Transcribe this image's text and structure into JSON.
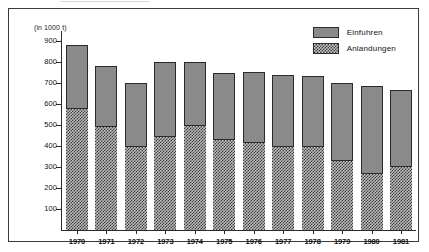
{
  "figure": {
    "unit_label": "(in 1000 t)"
  },
  "legend": {
    "items": [
      {
        "label": "Einfuhren",
        "pattern": "solid",
        "color": "#8a8a8a"
      },
      {
        "label": "Anlandungen",
        "pattern": "checkerboard",
        "color": "#3d3d3d"
      }
    ]
  },
  "axis": {
    "y_ticks": [
      900,
      800,
      700,
      600,
      500,
      400,
      300,
      200,
      100
    ],
    "y_tick_labels": [
      "900",
      "800",
      "700",
      "600",
      "500",
      "400",
      "300",
      "200",
      "100"
    ],
    "x_labels": [
      "1970",
      "1971",
      "1972",
      "1973",
      "1974",
      "1975",
      "1976",
      "1977",
      "1978",
      "1979",
      "1980",
      "1981"
    ]
  },
  "chart_data": {
    "type": "bar",
    "title": "",
    "subtitle": "",
    "xlabel": "",
    "ylabel": "(in 1000 t)",
    "ylim": [
      0,
      950
    ],
    "grid": false,
    "stacked": true,
    "legend_position": "top-right",
    "categories": [
      "1970",
      "1971",
      "1972",
      "1973",
      "1974",
      "1975",
      "1976",
      "1977",
      "1978",
      "1979",
      "1980",
      "1981"
    ],
    "series": [
      {
        "name": "Anlandungen",
        "values": [
          583,
          498,
          400,
          450,
          500,
          435,
          422,
          400,
          402,
          335,
          270,
          305
        ]
      },
      {
        "name": "Einfuhren",
        "values": [
          302,
          287,
          300,
          350,
          303,
          315,
          330,
          338,
          331,
          368,
          417,
          365
        ]
      }
    ],
    "totals": [
      885,
      785,
      700,
      800,
      803,
      750,
      752,
      738,
      733,
      703,
      687,
      670
    ]
  }
}
